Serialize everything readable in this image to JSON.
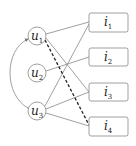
{
  "diagram": {
    "user_nodes": [
      {
        "id": "u1",
        "base": "u",
        "sub": "1",
        "cx": 37,
        "cy": 36
      },
      {
        "id": "u2",
        "base": "u",
        "sub": "2",
        "cx": 37,
        "cy": 73
      },
      {
        "id": "u3",
        "base": "u",
        "sub": "3",
        "cx": 37,
        "cy": 111
      }
    ],
    "item_nodes": [
      {
        "id": "i1",
        "base": "i",
        "sub": "1",
        "y": 13
      },
      {
        "id": "i2",
        "base": "i",
        "sub": "2",
        "y": 48
      },
      {
        "id": "i3",
        "base": "i",
        "sub": "3",
        "y": 83
      },
      {
        "id": "i4",
        "base": "i",
        "sub": "4",
        "y": 117
      }
    ],
    "edges": [
      {
        "from": "u1",
        "to": "i1",
        "style": "solid"
      },
      {
        "from": "u1",
        "to": "i3",
        "style": "solid"
      },
      {
        "from": "u1",
        "to": "i4",
        "style": "dashed"
      },
      {
        "from": "u2",
        "to": "i2",
        "style": "solid"
      },
      {
        "from": "u3",
        "to": "i1",
        "style": "solid"
      },
      {
        "from": "u3",
        "to": "i3",
        "style": "solid"
      },
      {
        "from": "u3",
        "to": "i4",
        "style": "solid"
      }
    ],
    "arcs": [
      {
        "from": "u3",
        "to": "u1",
        "style": "bidirectional-curve"
      }
    ],
    "colors": {
      "stroke": "#777777",
      "dashed": "#222222",
      "text": "#222222"
    }
  }
}
